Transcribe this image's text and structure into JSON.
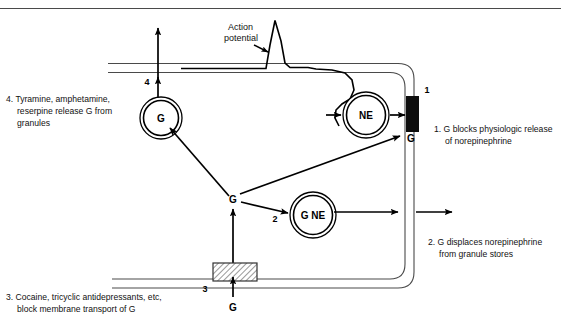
{
  "figure": {
    "action_potential_label_line1": "Action",
    "action_potential_label_line2": "potential"
  },
  "colors": {
    "ink": "#000000",
    "membrane": "#4a4a4a",
    "text": "#111111",
    "background": "#ffffff",
    "transporter_block": "#0d0d0d",
    "hatch_block": "#ffffff"
  },
  "nodes": {
    "granule_upper_left": {
      "label": "G",
      "name": "granule-upper-left"
    },
    "free_g": {
      "label": "G",
      "name": "free-transmitter-g"
    },
    "ne_vesicle": {
      "label": "NE",
      "name": "ne-vesicle"
    },
    "g_ne_granule": {
      "label": "G NE",
      "name": "g-ne-granule"
    },
    "release_site_g": {
      "label": "G",
      "name": "release-site-g"
    },
    "uptake_g": {
      "label": "G",
      "name": "uptake-g"
    }
  },
  "markers": {
    "marker_1": "1",
    "marker_2": "2",
    "marker_3": "3",
    "marker_4": "4"
  },
  "captions": [
    {
      "id": "caption-4",
      "number": "4.",
      "lines": [
        "4. Tyramine, amphetamine,",
        "reserpine release G from",
        "granules"
      ]
    },
    {
      "id": "caption-1",
      "number": "1.",
      "lines": [
        "1. G blocks physiologic release",
        "of norepinephrine"
      ]
    },
    {
      "id": "caption-2",
      "number": "2.",
      "lines": [
        "2. G displaces norepinephrine",
        "from granule stores"
      ]
    },
    {
      "id": "caption-3",
      "number": "3.",
      "lines": [
        "3. Cocaine, tricyclic antidepressants, etc,",
        "block membrane transport of G"
      ]
    }
  ],
  "caption4": {
    "l1": "4. Tyramine, amphetamine,",
    "l2": "reserpine release G from",
    "l3": "granules"
  },
  "caption1": {
    "l1": "1. G blocks physiologic release",
    "l2": "of norepinephrine"
  },
  "caption2": {
    "l1": "2. G displaces norepinephrine",
    "l2": "from granule stores"
  },
  "caption3": {
    "l1": "3. Cocaine, tricyclic antidepressants, etc,",
    "l2": "block membrane transport of G"
  }
}
